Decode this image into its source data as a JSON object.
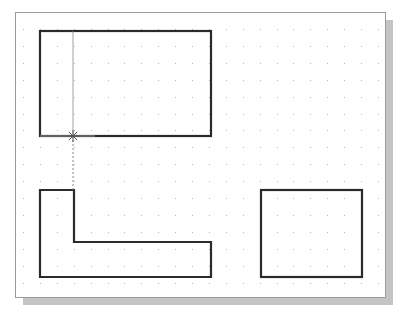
{
  "canvas": {
    "left": 15,
    "top": 12,
    "right": 385,
    "bottom": 297,
    "border_color": "#9a9a9a",
    "background": "#ffffff",
    "shadow_color": "#c4c4c4",
    "shadow_offset": 8
  },
  "grid": {
    "spacing": 16.9,
    "origin_x": 23,
    "origin_y": 29,
    "dot_color": "#b8b8b8"
  },
  "shapes": [
    {
      "name": "top-rectangle",
      "type": "rect",
      "x": 40,
      "y": 31,
      "w": 171,
      "h": 105
    },
    {
      "name": "l-shape",
      "type": "polygon",
      "points": [
        [
          40,
          190
        ],
        [
          74,
          190
        ],
        [
          74,
          242
        ],
        [
          211,
          242
        ],
        [
          211,
          277
        ],
        [
          40,
          277
        ]
      ]
    },
    {
      "name": "right-rectangle",
      "type": "rect",
      "x": 261,
      "y": 190,
      "w": 101,
      "h": 87
    }
  ],
  "stroke": {
    "color": "#2a2a2a",
    "width": 2.2
  },
  "construction_line": {
    "x": 73,
    "y_start": 31,
    "y_cursor": 136,
    "y_end": 190,
    "color": "#8a8a8a"
  },
  "cursor": {
    "x": 73,
    "y": 136,
    "glyph": "snap-cross-cursor"
  },
  "snap_tracking_line": {
    "x1": 40,
    "y": 136,
    "x2": 95,
    "color": "#9a9a9a"
  }
}
